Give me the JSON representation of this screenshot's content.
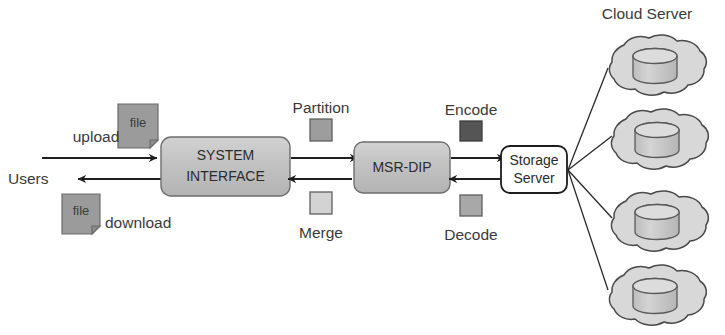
{
  "diagram": {
    "title_label": "Cloud Server",
    "actors": {
      "users_label": "Users",
      "upload_label": "upload",
      "download_label": "download"
    },
    "file_icons": [
      {
        "name": "upload-file",
        "label": "file"
      },
      {
        "name": "download-file",
        "label": "file"
      }
    ],
    "nodes": [
      {
        "id": "system-interface",
        "line1": "SYSTEM",
        "line2": "INTERFACE",
        "fill": "#c3c3c3",
        "stroke": "#6e6e6e"
      },
      {
        "id": "msr-dip",
        "line1": "MSR-DIP",
        "line2": "",
        "fill": "#c0c0c0",
        "stroke": "#6e6e6e"
      },
      {
        "id": "storage-server",
        "line1": "Storage",
        "line2": "Server",
        "fill": "#ffffff",
        "stroke": "#1c1c1c"
      }
    ],
    "legend_swatches": [
      {
        "id": "partition",
        "label": "Partition",
        "color": "#9d9d9d",
        "position": "above"
      },
      {
        "id": "merge",
        "label": "Merge",
        "color": "#d3d3d3",
        "position": "below"
      },
      {
        "id": "encode",
        "label": "Encode",
        "color": "#555555",
        "position": "above"
      },
      {
        "id": "decode",
        "label": "Decode",
        "color": "#a8a8a8",
        "position": "below"
      }
    ],
    "clouds": [
      {
        "id": "cloud-1",
        "storage_icon": "database-cylinder"
      },
      {
        "id": "cloud-2",
        "storage_icon": "database-cylinder"
      },
      {
        "id": "cloud-3",
        "storage_icon": "database-cylinder"
      },
      {
        "id": "cloud-4",
        "storage_icon": "database-cylinder"
      }
    ],
    "colors": {
      "cloud_fill": "#d8d8d8",
      "cloud_stroke": "#4a4a4a",
      "cylinder_fill": "#c6c6c6",
      "cylinder_top": "#d9d9d9",
      "arrow": "#1f1f1f",
      "file_fill": "#9b9b9b",
      "file_stroke": "#6b6b6b",
      "text": "#3a3a3a"
    }
  }
}
